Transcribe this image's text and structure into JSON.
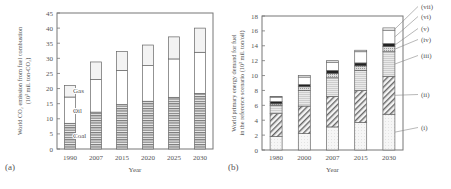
{
  "chart_data": [
    {
      "type": "bar",
      "stacked": true,
      "panel_label": "(a)",
      "title": "",
      "xlabel": "Year",
      "ylabel": "World CO2 emission from fuel combustion (10^3 mil. ton-CO2)",
      "ylim": [
        0,
        45
      ],
      "yticks": [
        0,
        5,
        10,
        15,
        20,
        25,
        30,
        35,
        40,
        45
      ],
      "categories": [
        "1990",
        "2007",
        "2015",
        "2020",
        "2025",
        "2030"
      ],
      "series": [
        {
          "name": "Coal",
          "values": [
            8.5,
            12.2,
            14.7,
            15.8,
            17.1,
            18.4
          ]
        },
        {
          "name": "Oil",
          "values": [
            8.7,
            10.8,
            11.3,
            11.8,
            12.7,
            13.6
          ]
        },
        {
          "name": "Gas",
          "values": [
            3.8,
            5.8,
            6.3,
            6.8,
            7.3,
            8.0
          ]
        }
      ],
      "totals": [
        21,
        28.8,
        32.3,
        34.4,
        37.1,
        40
      ],
      "annotations": [
        "Gas",
        "Oil",
        "Coal"
      ]
    },
    {
      "type": "bar",
      "stacked": true,
      "panel_label": "(b)",
      "title": "",
      "xlabel": "Year",
      "ylabel": "World primary energy demand for fuel in the reference scenario (10^3 mil. ton/oil)",
      "ylim": [
        0,
        18
      ],
      "yticks": [
        0,
        2,
        4,
        6,
        8,
        10,
        12,
        14,
        16,
        18
      ],
      "categories": [
        "1980",
        "2000",
        "2007",
        "2015",
        "2030"
      ],
      "series": [
        {
          "name": "(i)",
          "values": [
            1.8,
            2.2,
            3.1,
            3.7,
            4.8
          ]
        },
        {
          "name": "(ii)",
          "values": [
            3.1,
            3.7,
            4.1,
            4.3,
            5.1
          ]
        },
        {
          "name": "(iii)",
          "values": [
            1.1,
            2.1,
            2.5,
            2.7,
            3.3
          ]
        },
        {
          "name": "(iv)",
          "values": [
            0.2,
            0.5,
            0.6,
            0.6,
            0.7
          ]
        },
        {
          "name": "(v)",
          "values": [
            0.3,
            0.3,
            0.4,
            0.4,
            0.4
          ]
        },
        {
          "name": "(vi)",
          "values": [
            0.6,
            1.0,
            1.1,
            1.5,
            1.8
          ]
        },
        {
          "name": "(vii)",
          "values": [
            0.1,
            0.2,
            0.2,
            0.2,
            0.3
          ]
        }
      ],
      "totals": [
        7.2,
        10.0,
        12.0,
        13.4,
        16.7
      ],
      "legend_position": "right"
    }
  ]
}
